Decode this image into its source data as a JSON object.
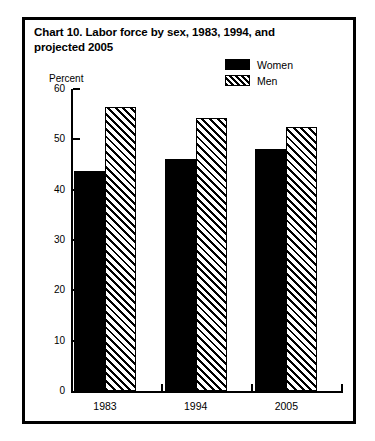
{
  "chart_data": {
    "type": "bar",
    "title": "Chart 10.  Labor force by sex, 1983, 1994, and projected 2005",
    "xlabel": "",
    "ylabel": "Percent",
    "ylim": [
      0,
      60
    ],
    "yticks": [
      0,
      10,
      20,
      30,
      40,
      50,
      60
    ],
    "ytick_labels": [
      "0",
      "10",
      "20",
      "30",
      "40",
      "50",
      "60"
    ],
    "categories": [
      "1983",
      "1994",
      "2005"
    ],
    "grid": false,
    "legend_position": "top-right",
    "series": [
      {
        "name": "Women",
        "values": [
          43.7,
          46.0,
          48.0
        ],
        "swatch": "solid-black"
      },
      {
        "name": "Men",
        "values": [
          56.5,
          54.2,
          52.5
        ],
        "swatch": "diagonal-hatch"
      }
    ]
  },
  "colors": {
    "foreground": "#000000",
    "background": "#ffffff"
  }
}
